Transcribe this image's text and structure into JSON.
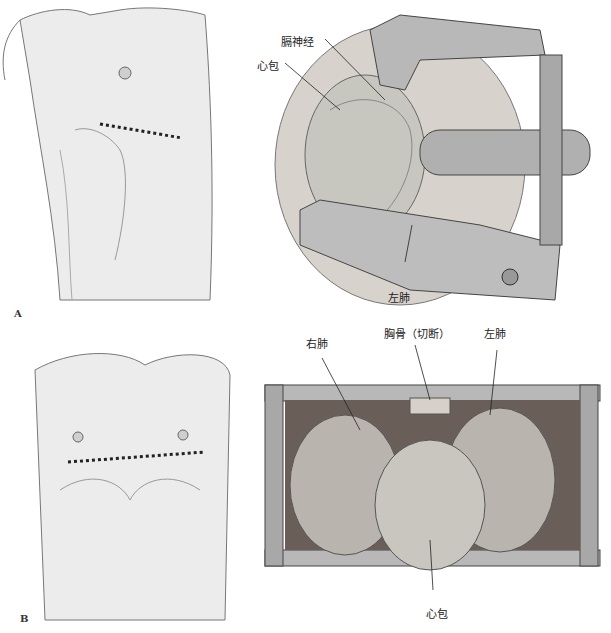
{
  "figure": {
    "panel_a": {
      "letter": "A",
      "labels": {
        "phrenic_nerve": "膈神经",
        "pericardium": "心包",
        "left_lung": "左肺"
      }
    },
    "panel_b": {
      "letter": "B",
      "labels": {
        "right_lung": "右肺",
        "sternum_divided": "胸骨（切断）",
        "left_lung": "左肺",
        "pericardium": "心包"
      }
    }
  }
}
